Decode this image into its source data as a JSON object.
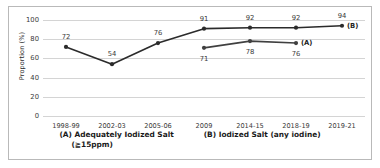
{
  "chart_data": {
    "type": "line",
    "title": "",
    "xlabel": "",
    "ylabel": "Proportion (%)",
    "ylim": [
      0,
      100
    ],
    "yticks": [
      0,
      20,
      40,
      60,
      80,
      100
    ],
    "grid": true,
    "legend_position": "bottom",
    "categories": [
      "1998-99",
      "2002-03",
      "2005-06",
      "2009",
      "2014-15",
      "2018-19",
      "2019-21"
    ],
    "series": [
      {
        "name": "(A) Adequately Iodized Salt (≧15ppm)",
        "short_name": "(A)",
        "color": "#404040",
        "marker": "circle",
        "values": [
          null,
          null,
          null,
          71,
          78,
          76,
          null
        ],
        "labels": [
          "",
          "",
          "",
          "71",
          "78",
          "76",
          ""
        ],
        "label_positions": [
          "",
          "",
          "",
          "below",
          "below",
          "below",
          ""
        ]
      },
      {
        "name": "(B) Iodized Salt (any iodine)",
        "short_name": "(B)",
        "color": "#2b2b2b",
        "marker": "circle",
        "values": [
          72,
          54,
          76,
          91,
          92,
          92,
          94
        ],
        "labels": [
          "72",
          "54",
          "76",
          "91",
          "92",
          "92",
          "94"
        ],
        "label_positions": [
          "above",
          "above",
          "above",
          "above",
          "above",
          "above",
          "above"
        ]
      }
    ]
  },
  "legend": {
    "entry_a_line1": "(A) Adequately Iodized Salt",
    "entry_a_line2": "(≧15ppm)",
    "entry_b_line1": "(B) Iodized Salt (any iodine)"
  },
  "axis": {
    "y_title": "Proportion (%)"
  }
}
